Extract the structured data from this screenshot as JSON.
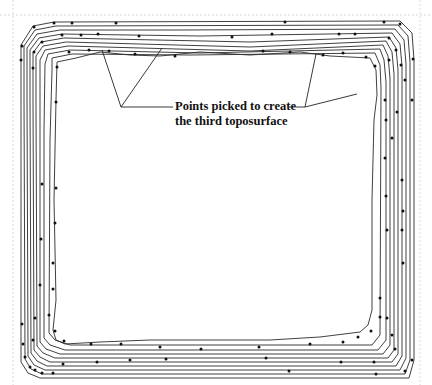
{
  "figure": {
    "type": "contour-diagram",
    "annotation": {
      "line1": "Points picked to create",
      "line2": "the third toposurface"
    },
    "contour_count": 10,
    "colors": {
      "line": "#2a2a2a",
      "point": "#111111",
      "guide": "#d6d6d6",
      "background": "#ffffff"
    }
  }
}
